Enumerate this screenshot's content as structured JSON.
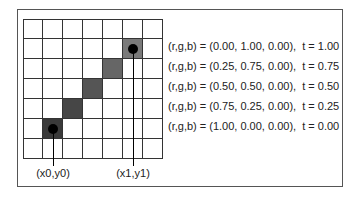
{
  "diagram": {
    "grid": {
      "cols": 7,
      "rows": 7,
      "cell_size": 20
    },
    "shaded_cells": [
      {
        "col": 1,
        "row": 5,
        "color": "#3a3a3a",
        "t": "0.00"
      },
      {
        "col": 2,
        "row": 4,
        "color": "#464646",
        "t": "0.25"
      },
      {
        "col": 3,
        "row": 3,
        "color": "#555555",
        "t": "0.50"
      },
      {
        "col": 4,
        "row": 2,
        "color": "#666666",
        "t": "0.75"
      },
      {
        "col": 5,
        "row": 1,
        "color": "#7a7a7a",
        "t": "1.00"
      }
    ],
    "endpoints": [
      {
        "label": "(x0,y0)",
        "col": 1,
        "row": 5
      },
      {
        "label": "(x1,y1)",
        "col": 5,
        "row": 1
      }
    ],
    "legend": [
      "(r,g,b) = (0.00, 1.00, 0.00),  t = 1.00",
      "(r,g,b) = (0.25, 0.75, 0.00),  t = 0.75",
      "(r,g,b) = (0.50, 0.50, 0.00),  t = 0.50",
      "(r,g,b) = (0.75, 0.25, 0.00),  t = 0.25",
      "(r,g,b) = (1.00, 0.00, 0.00),  t = 0.00"
    ]
  }
}
